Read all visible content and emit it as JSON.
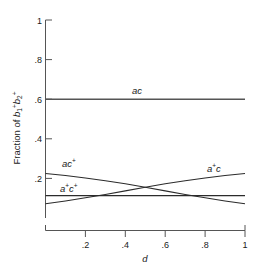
{
  "chart_data": {
    "type": "line",
    "title": "",
    "xlabel": "d",
    "ylabel": "Fraction of b1+b2+",
    "ylabel_parts": {
      "prefix": "Fraction of ",
      "b1": "b",
      "b1sub": "1",
      "b1sup": "+",
      "b2": "b",
      "b2sub": "2",
      "b2sup": "+"
    },
    "xlim": [
      0,
      1
    ],
    "ylim": [
      0,
      1
    ],
    "grid": false,
    "legend": "inline-curve-labels",
    "xticks": [
      0.2,
      0.4,
      0.6,
      0.8,
      1
    ],
    "xtick_labels": [
      ".2",
      ".4",
      ".6",
      ".8",
      "1"
    ],
    "yticks": [
      0.2,
      0.4,
      0.6,
      0.8,
      1
    ],
    "ytick_labels": [
      ".2",
      ".4",
      ".6",
      ".8",
      "1"
    ],
    "x": [
      0,
      0.1,
      0.2,
      0.3,
      0.4,
      0.5,
      0.6,
      0.7,
      0.8,
      0.9,
      1
    ],
    "series": [
      {
        "name": "ac",
        "label_base": "ac",
        "label_sup": "",
        "values": [
          0.6,
          0.6,
          0.6,
          0.6,
          0.6,
          0.6,
          0.6,
          0.6,
          0.6,
          0.6,
          0.6
        ],
        "style": "thick"
      },
      {
        "name": "ac+",
        "label_base": "ac",
        "label_sup": "+",
        "values": [
          0.225,
          0.215,
          0.202,
          0.188,
          0.173,
          0.155,
          0.137,
          0.119,
          0.102,
          0.086,
          0.072
        ],
        "style": "thin"
      },
      {
        "name": "a+c",
        "label_base": "a",
        "label_sup": "+",
        "label_tail": "c",
        "values": [
          0.072,
          0.086,
          0.102,
          0.119,
          0.137,
          0.155,
          0.173,
          0.188,
          0.202,
          0.215,
          0.225
        ],
        "style": "thin"
      },
      {
        "name": "a+c+",
        "label_base": "a",
        "label_sup": "+",
        "label_tail": "c",
        "label_tail_sup": "+",
        "values": [
          0.113,
          0.113,
          0.113,
          0.113,
          0.113,
          0.113,
          0.113,
          0.113,
          0.113,
          0.113,
          0.113
        ],
        "style": "thin"
      }
    ],
    "annotations": [
      {
        "text": "ac",
        "sup": "",
        "x": 0.46,
        "y": 0.645
      },
      {
        "text": "ac",
        "sup": "+",
        "x": 0.085,
        "y": 0.275
      },
      {
        "text": "a+c",
        "sup": "",
        "x": 0.8,
        "y": 0.255
      },
      {
        "text": "a+c+",
        "sup": "",
        "x": 0.085,
        "y": 0.165
      }
    ],
    "colors": {
      "curve": "#2b2b2b",
      "axis": "#555555",
      "background": "#ffffff",
      "text": "#1a1a1a"
    }
  },
  "labels": {
    "ytick_1": "1",
    "ytick_08": ".8",
    "ytick_06": ".6",
    "ytick_04": ".4",
    "ytick_02": ".2",
    "xtick_02": ".2",
    "xtick_04": ".4",
    "xtick_06": ".6",
    "xtick_08": ".8",
    "xtick_1": "1",
    "xaxis_title": "d",
    "yaxis_prefix": "Fraction of ",
    "yaxis_b": "b",
    "yaxis_sub1": "1",
    "yaxis_sub2": "2",
    "plus": "+",
    "curve_ac": "ac",
    "curve_ac_plus_base": "ac",
    "curve_aplus_c_a": "a",
    "curve_aplus_c_c": "c",
    "curve_aplus_cplus_a": "a",
    "curve_aplus_cplus_c": "c"
  }
}
